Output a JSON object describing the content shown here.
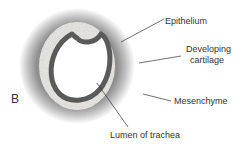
{
  "figure": {
    "panel_label": "B",
    "labels": {
      "epithelium": "Epithelium",
      "cartilage_line1": "Developing",
      "cartilage_line2": "cartilage",
      "mesenchyme": "Mesenchyme",
      "lumen": "Lumen of trachea"
    },
    "colors": {
      "epithelium": "#555555",
      "cartilage": "#e8e6e2",
      "mesenchyme": "#9a9a9a",
      "lumen": "#ffffff"
    }
  }
}
